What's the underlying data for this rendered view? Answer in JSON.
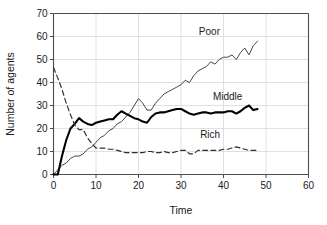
{
  "chart_data": {
    "type": "line",
    "title": "",
    "xlabel": "Time",
    "ylabel": "Number of agents",
    "xlim": [
      0,
      60
    ],
    "ylim": [
      0,
      70
    ],
    "xticks": [
      0,
      10,
      20,
      30,
      40,
      50,
      60
    ],
    "yticks": [
      0,
      10,
      20,
      30,
      40,
      50,
      60,
      70
    ],
    "xtick_labels": [
      "0",
      "10",
      "20",
      "30",
      "40",
      "50",
      "60"
    ],
    "ytick_labels": [
      "0",
      "10",
      "20",
      "30",
      "40",
      "50",
      "60",
      "70"
    ],
    "grid": true,
    "legend": "inline-annotations",
    "series": [
      {
        "name": "Poor",
        "style": "thin-solid",
        "color": "#3c3c3c",
        "label_x": 34.2,
        "label_y": 60.5,
        "x": [
          0,
          1,
          2,
          3,
          4,
          5,
          6,
          7,
          8,
          9,
          10,
          11,
          12,
          13,
          14,
          15,
          16,
          17,
          18,
          19,
          20,
          21,
          22,
          23,
          24,
          25,
          26,
          27,
          28,
          29,
          30,
          31,
          32,
          33,
          34,
          35,
          36,
          37,
          38,
          39,
          40,
          41,
          42,
          43,
          44,
          45,
          46,
          47,
          48
        ],
        "values": [
          0,
          2,
          4,
          5,
          7,
          8,
          8,
          9,
          11,
          12,
          14,
          16,
          17,
          19,
          20,
          22,
          23,
          25,
          27,
          30,
          33,
          31,
          28,
          28,
          31,
          33,
          35,
          36,
          37,
          38,
          39,
          41,
          40,
          43,
          45,
          46,
          47,
          49,
          48,
          50,
          51,
          51,
          52,
          50,
          53,
          55,
          52,
          56,
          58
        ]
      },
      {
        "name": "Middle",
        "style": "thick-solid",
        "color": "#000000",
        "label_x": 37.5,
        "label_y": 32.5,
        "x": [
          0,
          1,
          2,
          3,
          4,
          5,
          6,
          7,
          8,
          9,
          10,
          11,
          12,
          13,
          14,
          15,
          16,
          17,
          18,
          19,
          20,
          21,
          22,
          23,
          24,
          25,
          26,
          27,
          28,
          29,
          30,
          31,
          32,
          33,
          34,
          35,
          36,
          37,
          38,
          39,
          40,
          41,
          42,
          43,
          44,
          45,
          46,
          47,
          48
        ],
        "values": [
          0,
          0,
          8,
          15,
          20,
          22,
          24.5,
          23,
          22,
          21.5,
          22.5,
          23,
          23.5,
          24,
          24,
          26,
          27.5,
          26.5,
          25.5,
          24.5,
          24,
          23,
          22.5,
          25,
          26.5,
          27,
          27,
          27.5,
          28,
          28.5,
          28.5,
          27.5,
          26.5,
          26,
          26.5,
          27,
          27,
          26.5,
          27,
          27,
          27,
          27.5,
          27.5,
          26.5,
          27.5,
          29,
          30,
          28,
          28.5
        ]
      },
      {
        "name": "Rich",
        "style": "dashed",
        "color": "#2e2e2e",
        "label_x": 34.5,
        "label_y": 16.0,
        "x": [
          0,
          1,
          2,
          3,
          4,
          5,
          6,
          7,
          8,
          9,
          10,
          11,
          12,
          13,
          14,
          15,
          16,
          17,
          18,
          19,
          20,
          21,
          22,
          23,
          24,
          25,
          26,
          27,
          28,
          29,
          30,
          31,
          32,
          33,
          34,
          35,
          36,
          37,
          38,
          39,
          40,
          41,
          42,
          43,
          44,
          45,
          46,
          47,
          48
        ],
        "values": [
          46.5,
          42,
          37,
          31,
          26,
          21.5,
          19.5,
          19.5,
          16,
          13.5,
          11.5,
          11.5,
          11.5,
          11,
          11,
          10.5,
          10,
          9.5,
          9.5,
          9.5,
          9.5,
          9.5,
          10,
          10,
          9.5,
          9.5,
          10,
          9.5,
          9.5,
          10,
          10.5,
          10.5,
          9,
          9,
          10.5,
          10.5,
          10.5,
          10.5,
          10.5,
          10.5,
          11,
          11,
          11.5,
          12,
          11.5,
          11,
          10.5,
          10.5,
          10.5
        ]
      }
    ]
  },
  "axes": {
    "x_title": "Time",
    "y_title": "Number of agents"
  }
}
